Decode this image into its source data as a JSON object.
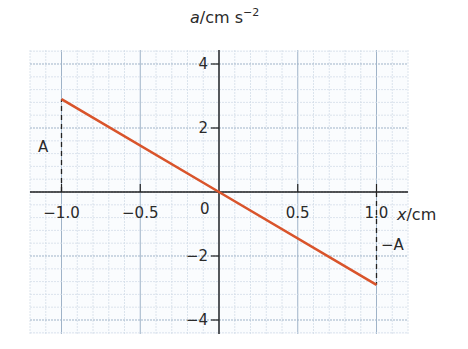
{
  "chart_data": {
    "type": "line",
    "title": "",
    "xlabel": "x/cm",
    "ylabel": "a/cm s^-2",
    "xlabel_var": "x",
    "xlabel_unit": "/cm",
    "ylabel_var": "a",
    "ylabel_unit": "/cm s",
    "ylabel_exp": "−2",
    "xlim": [
      -1.2,
      1.2
    ],
    "ylim": [
      -4.4,
      4.4
    ],
    "x_ticks": [
      -1.0,
      -0.5,
      0.5,
      1.0
    ],
    "x_tick_labels": [
      "−1.0",
      "−0.5",
      "0.5",
      "1.0"
    ],
    "y_ticks": [
      4,
      2,
      -2,
      -4
    ],
    "y_tick_labels": [
      "4",
      "2",
      "−2",
      "−4"
    ],
    "origin_label": "0",
    "grid": true,
    "series": [
      {
        "name": "acceleration vs displacement",
        "color": "#d9542b",
        "x": [
          -1.0,
          0.0,
          1.0
        ],
        "y": [
          2.9,
          0.0,
          -2.9
        ]
      }
    ],
    "annotations": [
      {
        "text": "A",
        "x": -1.0,
        "y": 1.2,
        "note": "dashed line from x-axis to a=+A value at x=-1.0"
      },
      {
        "text": "−A",
        "x": 1.0,
        "y": -1.2,
        "note": "dashed line from x-axis to a=-A value at x=1.0"
      }
    ],
    "legend": null
  }
}
